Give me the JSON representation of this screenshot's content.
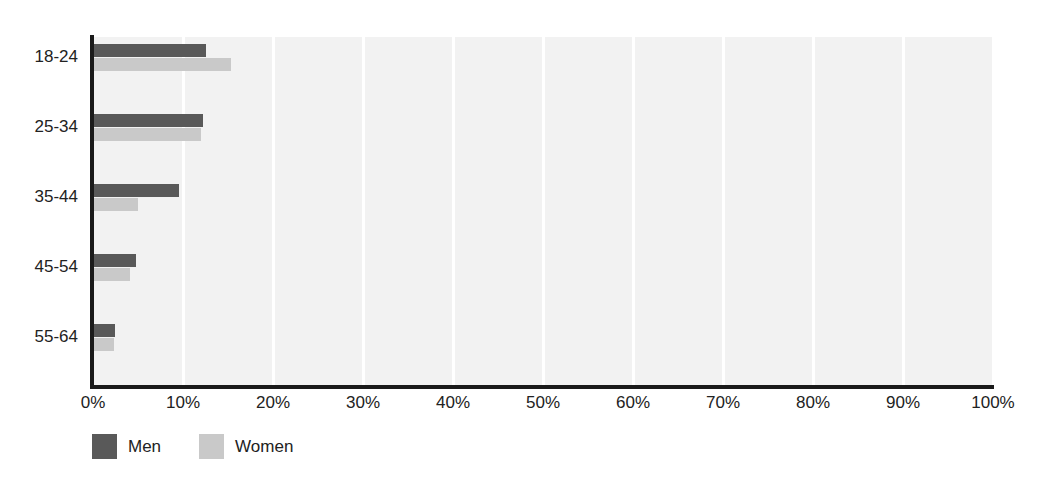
{
  "chart_data": {
    "type": "bar",
    "orientation": "horizontal",
    "title": "",
    "xlabel": "",
    "ylabel": "",
    "categories": [
      "18-24",
      "25-34",
      "35-44",
      "45-54",
      "55-64"
    ],
    "series": [
      {
        "name": "Men",
        "color": "#595959",
        "values": [
          12.6,
          12.2,
          9.6,
          4.8,
          2.4
        ]
      },
      {
        "name": "Women",
        "color": "#c9c9c9",
        "values": [
          15.3,
          12.0,
          5.0,
          4.1,
          2.3
        ]
      }
    ],
    "xlim": [
      0,
      100
    ],
    "xtick_labels": [
      "0%",
      "10%",
      "20%",
      "30%",
      "40%",
      "50%",
      "60%",
      "70%",
      "80%",
      "90%",
      "100%"
    ],
    "xtick_values": [
      0,
      10,
      20,
      30,
      40,
      50,
      60,
      70,
      80,
      90,
      100
    ],
    "grid": true,
    "grid_axis": "x",
    "grid_color": "#ffffff",
    "plot_background": "#f2f2f2",
    "axis_color": "#1a1a1a",
    "legend_position": "bottom-left",
    "value_format": "percent"
  }
}
